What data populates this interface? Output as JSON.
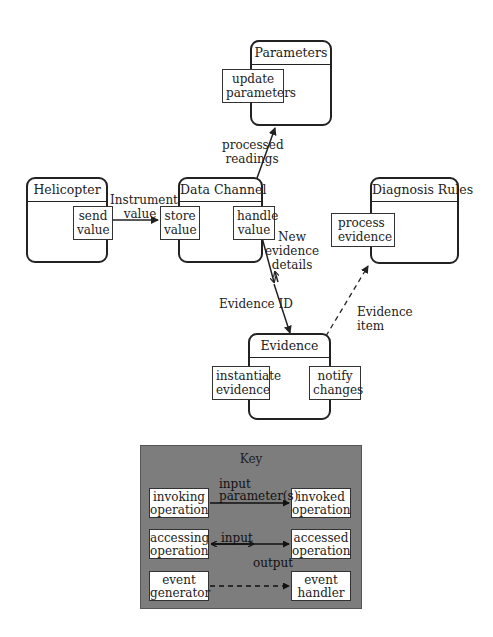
{
  "diagram": {
    "objects": {
      "parameters": {
        "title": "Parameters",
        "operations": [
          "update\nparameters"
        ]
      },
      "helicopter": {
        "title": "Helicopter",
        "operations": [
          "send\nvalue"
        ]
      },
      "data_channel": {
        "title": "Data Channel",
        "operations": [
          "store\nvalue",
          "handle\nvalue"
        ]
      },
      "diagnosis_rules": {
        "title": "Diagnosis Rules",
        "operations": [
          "process\nevidence"
        ]
      },
      "evidence": {
        "title": "Evidence",
        "operations": [
          "instantiate\nevidence",
          "notify\nchanges"
        ]
      }
    },
    "op_labels": {
      "update_parameters": [
        "update",
        "parameters"
      ],
      "send_value": [
        "send",
        "value"
      ],
      "store_value": [
        "store",
        "value"
      ],
      "handle_value": [
        "handle",
        "value"
      ],
      "process_evidence": [
        "process",
        "evidence"
      ],
      "instantiate_evidence": [
        "instantiate",
        "evidence"
      ],
      "notify_changes": [
        "notify",
        "changes"
      ]
    },
    "connections": {
      "instrument_value": [
        "Instrument",
        "value"
      ],
      "processed_readings": [
        "processed",
        "readings"
      ],
      "new_evidence_details": [
        "New",
        "evidence",
        "details"
      ],
      "evidence_id": "Evidence ID",
      "evidence_item": [
        "Evidence",
        "item"
      ]
    }
  },
  "key": {
    "title": "Key",
    "rows": [
      {
        "left": [
          "invoking",
          "operation"
        ],
        "right": [
          "invoked",
          "operation"
        ],
        "label_top": [
          "input",
          "parameter(s)"
        ],
        "style": "solid-single"
      },
      {
        "left": [
          "accessing",
          "operation"
        ],
        "right": [
          "accessed",
          "operation"
        ],
        "label_top": "input",
        "label_bottom": "output",
        "style": "solid-double"
      },
      {
        "left": [
          "event",
          "generator"
        ],
        "right": [
          "event",
          "handler"
        ],
        "style": "dashed"
      }
    ],
    "colors": {
      "background": "#7d7d7d",
      "box": "#ffffff",
      "line": "#222222"
    }
  }
}
